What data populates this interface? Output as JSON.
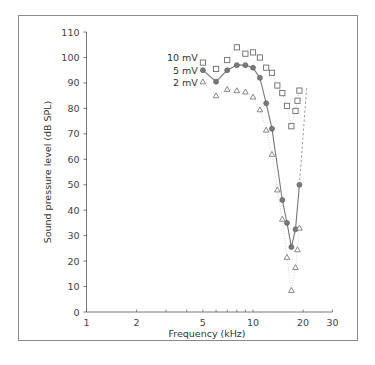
{
  "chart_data": {
    "type": "scatter",
    "title": "",
    "xlabel": "Frequency (kHz)",
    "ylabel": "Sound pressure level (dB SPL)",
    "xscale": "log",
    "xlim": [
      1,
      30
    ],
    "ylim": [
      0,
      110
    ],
    "x_ticks": [
      1,
      2,
      5,
      10,
      20,
      30
    ],
    "x_tick_labels": [
      "1",
      "2",
      "5",
      "10",
      "20",
      "30"
    ],
    "y_ticks": [
      0,
      10,
      20,
      30,
      40,
      50,
      60,
      70,
      80,
      90,
      100,
      110
    ],
    "y_tick_labels": [
      "0",
      "10",
      "20",
      "30",
      "40",
      "50",
      "60",
      "70",
      "80",
      "90",
      "100",
      "110"
    ],
    "grid": false,
    "legend_position": "inline, left of first data points",
    "series": [
      {
        "name": "10 mV",
        "marker": "square",
        "line": "dotted",
        "x": [
          5,
          6,
          7,
          8,
          9,
          10,
          11,
          12,
          13,
          14,
          15,
          16,
          17,
          18,
          18.5,
          19
        ],
        "values": [
          98,
          95.5,
          99,
          104,
          101.5,
          102,
          100,
          96,
          94,
          89,
          86,
          81,
          73,
          79,
          83,
          87
        ]
      },
      {
        "name": "5 mV",
        "marker": "circle",
        "line": "solid",
        "x": [
          5,
          6,
          7,
          8,
          9,
          10,
          11,
          12,
          13,
          15,
          16,
          17,
          18,
          19
        ],
        "values": [
          95,
          90.5,
          95,
          97,
          97,
          96,
          92,
          82,
          72,
          44,
          35,
          25.5,
          32.5,
          50
        ]
      },
      {
        "name": "2 mV",
        "marker": "triangle",
        "line": "dotted",
        "x": [
          5,
          6,
          7,
          8,
          9,
          10,
          11,
          12,
          13,
          14,
          15,
          16,
          17,
          18,
          18.5,
          19
        ],
        "values": [
          90.5,
          85,
          87.5,
          87,
          86.5,
          84.5,
          79.5,
          71.5,
          62,
          48,
          36.5,
          21.5,
          8.5,
          17.5,
          24.5,
          33
        ]
      }
    ],
    "annotations": [
      {
        "type": "dashed-line",
        "description": "dashed extrapolation from 5 mV last point upward to ~88 dB near 21 kHz"
      }
    ]
  },
  "labels": {
    "xlabel": "Frequency (kHz)",
    "ylabel": "Sound pressure level (dB SPL)",
    "legend": [
      "10 mV",
      "5 mV",
      "2 mV"
    ]
  }
}
